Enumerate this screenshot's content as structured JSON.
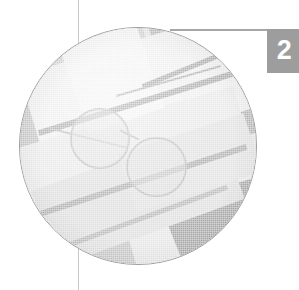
{
  "page": {
    "background_color": "#ffffff",
    "width": 299,
    "height": 290
  },
  "chapter_tab": {
    "number": "2",
    "background_color": "#9d9d9d",
    "text_color": "#ffffff"
  },
  "rules": {
    "vertical_rule_color": "#c9c9c9",
    "horizontal_rule_color": "#a6a6a6"
  },
  "photo": {
    "shape": "circle",
    "border_color": "#9e9e9e",
    "palette": {
      "lightest": "#f3f3f3",
      "light": "#e6e6e6",
      "mid": "#c4c4c4",
      "dark": "#a9a9a9",
      "darkest": "#9d9d9d"
    }
  }
}
